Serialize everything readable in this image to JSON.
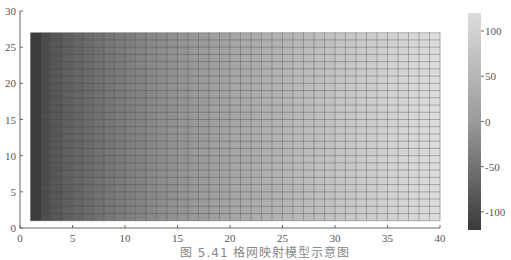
{
  "chart_data": {
    "type": "heatmap",
    "title": "",
    "xlabel": "",
    "ylabel": "",
    "xlim": [
      0,
      40
    ],
    "ylim": [
      0,
      30
    ],
    "x_ticks": [
      0,
      5,
      10,
      15,
      20,
      25,
      30,
      35,
      40
    ],
    "y_ticks": [
      0,
      5,
      10,
      15,
      20,
      25,
      30
    ],
    "grid_extent": {
      "x": [
        1,
        40
      ],
      "y": [
        1,
        27
      ]
    },
    "grid_cells": {
      "cols": 39,
      "rows": 26
    },
    "value_gradient": {
      "direction": "left-to-right",
      "left_value": -120,
      "right_value": 120
    },
    "colorbar": {
      "ticks": [
        100,
        50,
        0,
        -50,
        -100
      ],
      "range": [
        -120,
        120
      ],
      "colormap": "gray"
    },
    "caption": "图 5.41 格网映射模型示意图"
  },
  "caption": "图 5.41  格网映射模型示意图"
}
